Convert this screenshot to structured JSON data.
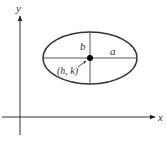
{
  "diagram": {
    "type": "ellipse-with-axes",
    "labels": {
      "x_axis": "x",
      "y_axis": "y",
      "semi_major": "a",
      "semi_minor": "b",
      "center": "(h, k)"
    },
    "colors": {
      "stroke": "#333333",
      "background": "#ffffff"
    }
  }
}
